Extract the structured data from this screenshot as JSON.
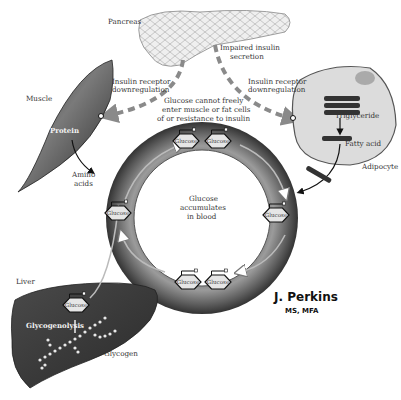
{
  "colors": {
    "ring_dark": "#3a3a3a",
    "ring_light": "#9a9a9a",
    "organ_dark": "#404040",
    "pancreas_fill": "#ededed",
    "adipocyte_fill": "#d9d9d9",
    "dashed_arrow": "#8a8a8a",
    "glucose_fill": "#e6e6e6"
  },
  "labels": {
    "pancreas": "Pancreas",
    "impaired_1": "Impaired insulin",
    "impaired_2": "secretion",
    "muscle": "Muscle",
    "protein": "Protein",
    "amino_1": "Amino",
    "amino_2": "acids",
    "receptor_left_1": "Insulin receptor",
    "receptor_left_2": "downregulation",
    "receptor_right_1": "Insulin receptor",
    "receptor_right_2": "downregulation",
    "cannot_1": "Glucose cannot freely",
    "cannot_2": "enter muscle or fat cells",
    "cannot_3": "of or resistance to insulin",
    "triglyceride": "Triglyceride",
    "fatty_acid": "Fatty acid",
    "adipocyte": "Adipocyte",
    "center_1": "Glucose",
    "center_2": "accumulates",
    "center_3": "in blood",
    "liver": "Liver",
    "glycogenolysis": "Glycogenolysis",
    "glycogen": "Glycogen"
  },
  "glucose_molecules": [
    {
      "label": "Glucose"
    },
    {
      "label": "Glucose"
    },
    {
      "label": "Glucose"
    },
    {
      "label": "Glucose"
    },
    {
      "label": "Glucose"
    },
    {
      "label": "Glucose"
    },
    {
      "label": "Glucose"
    }
  ],
  "credit": {
    "name": "J. Perkins",
    "degrees": "MS, MFA"
  }
}
